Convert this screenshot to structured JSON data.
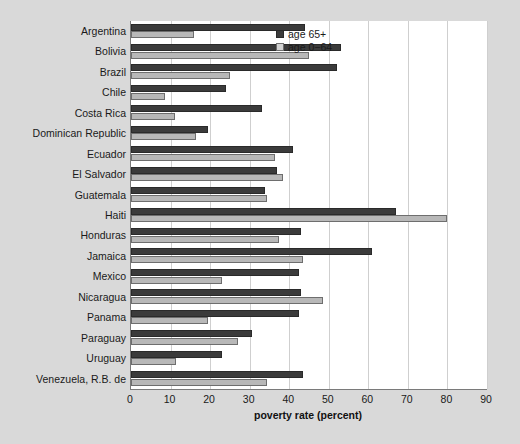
{
  "figure": {
    "background_color": "#d9d9d9",
    "plot_background_color": "#ffffff",
    "top_clipped_caption": "",
    "xlabel": "poverty rate (percent)"
  },
  "legend": {
    "position": "top-right",
    "items": [
      {
        "label": "age 65+",
        "color": "#3b3b3b"
      },
      {
        "label": "age 0−64",
        "color": "#d2d2d2"
      }
    ]
  },
  "chart_data": {
    "type": "bar",
    "orientation": "horizontal",
    "title": "",
    "subtitle": "",
    "xlabel": "poverty rate (percent)",
    "ylabel": "",
    "xlim": [
      0,
      90
    ],
    "xticks": [
      0,
      10,
      20,
      30,
      40,
      50,
      60,
      70,
      80,
      90
    ],
    "xtick_labels": [
      "0",
      "10",
      "20",
      "30",
      "40",
      "50",
      "60",
      "70",
      "80",
      "90"
    ],
    "grid": true,
    "grid_axis": "x",
    "legend_position": "upper right",
    "categories": [
      "Argentina",
      "Bolivia",
      "Brazil",
      "Chile",
      "Costa Rica",
      "Dominican Republic",
      "Ecuador",
      "El Salvador",
      "Guatemala",
      "Haiti",
      "Honduras",
      "Jamaica",
      "Mexico",
      "Nicaragua",
      "Panama",
      "Paraguay",
      "Uruguay",
      "Venezuela, R.B. de"
    ],
    "series": [
      {
        "name": "age 65+",
        "color": "#3b3b3b",
        "values": [
          44,
          53,
          52,
          24,
          33,
          19.5,
          41,
          37,
          34,
          67,
          43,
          61,
          42.5,
          43,
          42.5,
          30.5,
          23,
          43.5
        ]
      },
      {
        "name": "age 0−64",
        "color": "#d2d2d2",
        "values": [
          16,
          45,
          25,
          8.5,
          11,
          16.5,
          36.5,
          38.5,
          34.5,
          80,
          37.5,
          43.5,
          23,
          48.5,
          19.5,
          27,
          11.5,
          34.5
        ]
      }
    ]
  }
}
